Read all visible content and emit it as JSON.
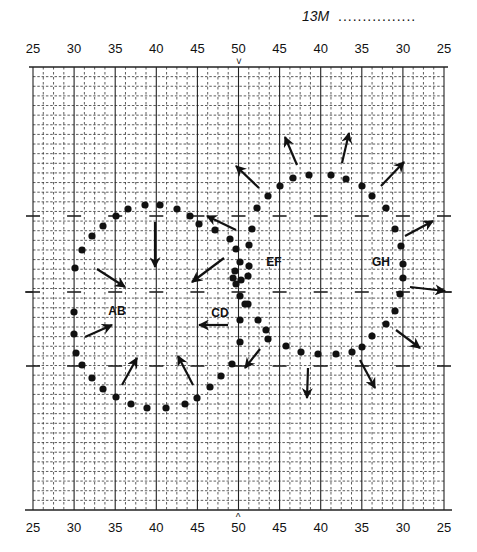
{
  "header": {
    "code": "13M",
    "dots": "................"
  },
  "axis": {
    "top_labels": [
      "25",
      "30",
      "35",
      "40",
      "45",
      "50",
      "45",
      "40",
      "35",
      "30",
      "25"
    ],
    "bottom_labels": [
      "25",
      "30",
      "35",
      "40",
      "45",
      "50",
      "45",
      "40",
      "35",
      "30",
      "25"
    ],
    "center_marker_top": "˅",
    "center_marker_bottom": "^"
  },
  "grid": {
    "left": 33,
    "right": 444,
    "top": 67,
    "bottom": 510,
    "major_cols": 10,
    "minor_per_major": 4,
    "row_step": 9.63,
    "dash_rows_y": [
      216,
      292,
      366
    ],
    "colors": {
      "line": "#222222",
      "minor": "#333333"
    }
  },
  "labels": [
    {
      "text": "AB",
      "x": 117,
      "y": 315
    },
    {
      "text": "CD",
      "x": 220,
      "y": 317
    },
    {
      "text": "EF",
      "x": 274,
      "y": 266
    },
    {
      "text": "GH",
      "x": 381,
      "y": 266
    }
  ],
  "dots": [
    [
      75,
      268
    ],
    [
      82,
      250
    ],
    [
      92,
      236
    ],
    [
      103,
      226
    ],
    [
      116,
      216
    ],
    [
      128,
      209
    ],
    [
      145,
      205
    ],
    [
      160,
      205
    ],
    [
      177,
      209
    ],
    [
      190,
      216
    ],
    [
      199,
      224
    ],
    [
      215,
      230
    ],
    [
      230,
      239
    ],
    [
      236,
      249
    ],
    [
      240,
      262
    ],
    [
      235,
      271
    ],
    [
      236,
      284
    ],
    [
      74,
      312
    ],
    [
      74,
      334
    ],
    [
      76,
      353
    ],
    [
      82,
      365
    ],
    [
      92,
      378
    ],
    [
      103,
      389
    ],
    [
      116,
      397
    ],
    [
      131,
      404
    ],
    [
      147,
      408
    ],
    [
      166,
      408
    ],
    [
      185,
      404
    ],
    [
      197,
      398
    ],
    [
      210,
      387
    ],
    [
      221,
      376
    ],
    [
      232,
      364
    ],
    [
      240,
      342
    ],
    [
      240,
      320
    ],
    [
      240,
      296
    ],
    [
      241,
      280
    ],
    [
      233,
      278
    ],
    [
      249,
      266
    ],
    [
      249,
      245
    ],
    [
      252,
      229
    ],
    [
      257,
      208
    ],
    [
      268,
      196
    ],
    [
      280,
      186
    ],
    [
      293,
      178
    ],
    [
      309,
      175
    ],
    [
      331,
      175
    ],
    [
      346,
      179
    ],
    [
      362,
      186
    ],
    [
      372,
      196
    ],
    [
      386,
      208
    ],
    [
      395,
      229
    ],
    [
      401,
      246
    ],
    [
      403,
      264
    ],
    [
      403,
      278
    ],
    [
      400,
      294
    ],
    [
      395,
      311
    ],
    [
      386,
      324
    ],
    [
      372,
      336
    ],
    [
      362,
      347
    ],
    [
      352,
      352
    ],
    [
      336,
      354
    ],
    [
      318,
      354
    ],
    [
      301,
      352
    ],
    [
      286,
      346
    ],
    [
      268,
      339
    ],
    [
      266,
      330
    ],
    [
      258,
      320
    ],
    [
      248,
      304
    ],
    [
      245,
      304
    ],
    [
      248,
      276
    ]
  ],
  "arrows": [
    {
      "x1": 155,
      "y1": 222,
      "x2": 155,
      "y2": 267
    },
    {
      "x1": 97,
      "y1": 269,
      "x2": 125,
      "y2": 287
    },
    {
      "x1": 85,
      "y1": 337,
      "x2": 112,
      "y2": 325
    },
    {
      "x1": 122,
      "y1": 385,
      "x2": 137,
      "y2": 358
    },
    {
      "x1": 193,
      "y1": 385,
      "x2": 178,
      "y2": 356
    },
    {
      "x1": 228,
      "y1": 325,
      "x2": 199,
      "y2": 325
    },
    {
      "x1": 224,
      "y1": 258,
      "x2": 192,
      "y2": 282
    },
    {
      "x1": 236,
      "y1": 230,
      "x2": 207,
      "y2": 216
    },
    {
      "x1": 260,
      "y1": 349,
      "x2": 245,
      "y2": 368
    },
    {
      "x1": 308,
      "y1": 368,
      "x2": 307,
      "y2": 398
    },
    {
      "x1": 360,
      "y1": 360,
      "x2": 375,
      "y2": 388
    },
    {
      "x1": 396,
      "y1": 330,
      "x2": 420,
      "y2": 348
    },
    {
      "x1": 410,
      "y1": 287,
      "x2": 445,
      "y2": 291
    },
    {
      "x1": 405,
      "y1": 236,
      "x2": 433,
      "y2": 221
    },
    {
      "x1": 381,
      "y1": 186,
      "x2": 404,
      "y2": 162
    },
    {
      "x1": 342,
      "y1": 163,
      "x2": 349,
      "y2": 133
    },
    {
      "x1": 297,
      "y1": 165,
      "x2": 285,
      "y2": 137
    },
    {
      "x1": 259,
      "y1": 188,
      "x2": 236,
      "y2": 166
    }
  ],
  "style": {
    "ink": "#111111",
    "background": "#ffffff"
  }
}
